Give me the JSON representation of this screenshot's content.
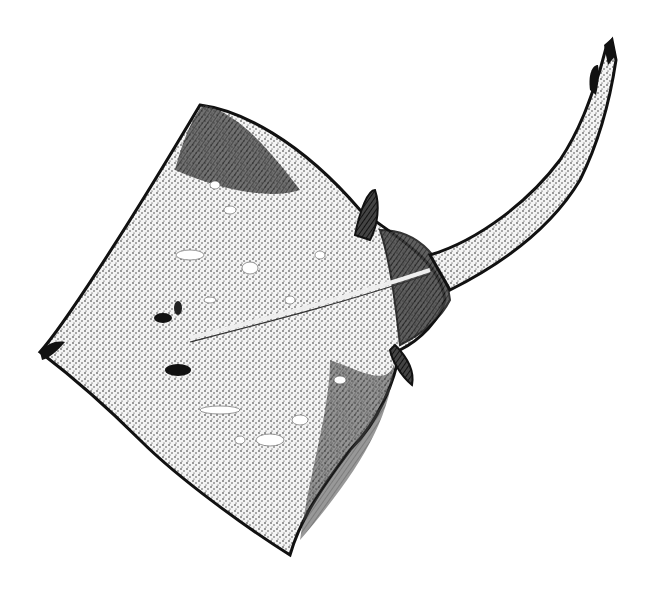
{
  "image": {
    "subject": "skate (ray fish) illustration",
    "style": "black and white stipple engraving",
    "background_color": "#ffffff",
    "ink_color": "#111111"
  }
}
